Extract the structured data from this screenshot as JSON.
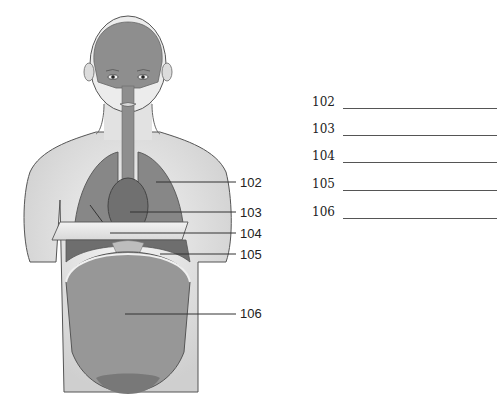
{
  "figure": {
    "colors": {
      "skin": "#e6e6e6",
      "skin_shadow": "#c4c4c4",
      "outline": "#555555",
      "cavity": "#8e8e8e",
      "cavity_dark": "#6f6f6f",
      "diaphragm_plate": "#ececec",
      "leader": "#333333"
    }
  },
  "callouts": [
    {
      "id": "102",
      "label": "102"
    },
    {
      "id": "103",
      "label": "103"
    },
    {
      "id": "104",
      "label": "104"
    },
    {
      "id": "105",
      "label": "105"
    },
    {
      "id": "106",
      "label": "106"
    }
  ],
  "answer_list": [
    {
      "number": "102",
      "value": ""
    },
    {
      "number": "103",
      "value": ""
    },
    {
      "number": "104",
      "value": ""
    },
    {
      "number": "105",
      "value": ""
    },
    {
      "number": "106",
      "value": ""
    }
  ]
}
